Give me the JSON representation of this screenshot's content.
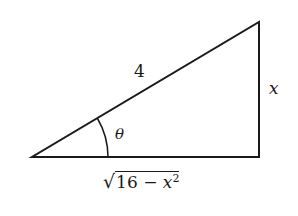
{
  "diagram": {
    "type": "right-triangle",
    "stroke_color": "#1a1a1a",
    "vertices": {
      "angle_vertex": [
        32,
        157
      ],
      "right_angle_vertex": [
        259,
        157
      ],
      "top_vertex": [
        259,
        22
      ]
    },
    "labels": {
      "hypotenuse": "4",
      "opposite": "x",
      "angle": "θ",
      "adjacent": {
        "radical": "√",
        "radicand_prefix": "16 − ",
        "variable": "x",
        "exponent": "2"
      }
    }
  }
}
